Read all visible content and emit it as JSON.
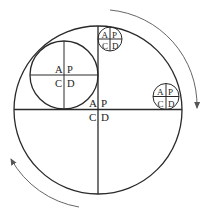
{
  "diagram": {
    "quadrant_labels": [
      "A",
      "P",
      "C",
      "D"
    ],
    "circles": [
      {
        "name": "main-cycle",
        "labels": {
          "top_left": "A",
          "top_right": "P",
          "bottom_left": "C",
          "bottom_right": "D"
        }
      },
      {
        "name": "medium-cycle",
        "labels": {
          "top_left": "A",
          "top_right": "P",
          "bottom_left": "C",
          "bottom_right": "D"
        }
      },
      {
        "name": "small-top-cycle",
        "labels": {
          "top_left": "A",
          "top_right": "P",
          "bottom_left": "C",
          "bottom_right": "D"
        }
      },
      {
        "name": "small-right-cycle",
        "labels": {
          "top_left": "A",
          "top_right": "P",
          "bottom_left": "C",
          "bottom_right": "D"
        }
      }
    ],
    "arrows": [
      {
        "name": "clockwise-arrow-top-right",
        "direction": "clockwise"
      },
      {
        "name": "clockwise-arrow-bottom-left",
        "direction": "clockwise"
      }
    ]
  }
}
